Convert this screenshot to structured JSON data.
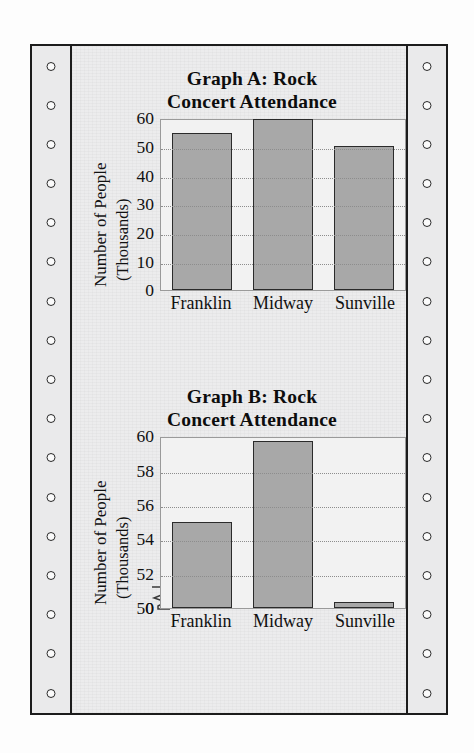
{
  "page": {
    "media": "continuous-feed-printout",
    "sprocket_holes_per_side": 17
  },
  "charts": [
    {
      "id": "graph-a",
      "title_line1": "Graph A: Rock",
      "title_line2": "Concert Attendance",
      "ylabel_line1": "Number of People",
      "ylabel_line2": "(Thousands)",
      "ticks": [
        "60",
        "50",
        "40",
        "30",
        "20",
        "10",
        "0"
      ],
      "categories": [
        "Franklin",
        "Midway",
        "Sunville"
      ]
    },
    {
      "id": "graph-b",
      "title_line1": "Graph B: Rock",
      "title_line2": "Concert Attendance",
      "ylabel_line1": "Number of People",
      "ylabel_line2": "(Thousands)",
      "ticks": [
        "60",
        "58",
        "56",
        "54",
        "52",
        "50",
        "0"
      ],
      "categories": [
        "Franklin",
        "Midway",
        "Sunville"
      ]
    }
  ],
  "chart_data": [
    {
      "type": "bar",
      "title": "Graph A: Rock Concert Attendance",
      "xlabel": "",
      "ylabel": "Number of People (Thousands)",
      "categories": [
        "Franklin",
        "Midway",
        "Sunville"
      ],
      "values": [
        55,
        59.7,
        50.3
      ],
      "ylim": [
        0,
        60
      ],
      "yticks": [
        0,
        10,
        20,
        30,
        40,
        50,
        60
      ],
      "grid": true,
      "axis_break": false,
      "legend": "none",
      "bar_fill": "#a8a8a8",
      "bar_edge": "#2b2b2b"
    },
    {
      "type": "bar",
      "title": "Graph B: Rock Concert Attendance",
      "xlabel": "",
      "ylabel": "Number of People (Thousands)",
      "categories": [
        "Franklin",
        "Midway",
        "Sunville"
      ],
      "values": [
        55,
        59.7,
        50.3
      ],
      "ylim": [
        50,
        60
      ],
      "yticks": [
        0,
        50,
        52,
        54,
        56,
        58,
        60
      ],
      "grid": true,
      "axis_break": true,
      "axis_break_between": [
        0,
        50
      ],
      "legend": "none",
      "bar_fill": "#a8a8a8",
      "bar_edge": "#2b2b2b"
    }
  ]
}
